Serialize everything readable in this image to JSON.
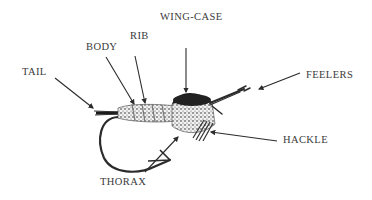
{
  "diagram": {
    "colors": {
      "ink": "#2b2b2b",
      "label": "#3a3a3a",
      "background": "#ffffff"
    },
    "labels": [
      {
        "id": "tail",
        "text": "TAIL",
        "x": 22,
        "y": 67
      },
      {
        "id": "body",
        "text": "BODY",
        "x": 86,
        "y": 42
      },
      {
        "id": "rib",
        "text": "RIB",
        "x": 130,
        "y": 31
      },
      {
        "id": "wing-case",
        "text": "WING-CASE",
        "x": 160,
        "y": 12
      },
      {
        "id": "feelers",
        "text": "FEELERS",
        "x": 306,
        "y": 70
      },
      {
        "id": "hackle",
        "text": "HACKLE",
        "x": 283,
        "y": 135
      },
      {
        "id": "thorax",
        "text": "THORAX",
        "x": 100,
        "y": 177
      }
    ],
    "arrows": [
      {
        "id": "tail",
        "x1": 55,
        "y1": 78,
        "x2": 93,
        "y2": 108
      },
      {
        "id": "body",
        "x1": 106,
        "y1": 57,
        "x2": 134,
        "y2": 104
      },
      {
        "id": "rib",
        "x1": 135,
        "y1": 56,
        "x2": 145,
        "y2": 103
      },
      {
        "id": "wing-case",
        "x1": 186,
        "y1": 48,
        "x2": 186,
        "y2": 92
      },
      {
        "id": "feelers",
        "x1": 300,
        "y1": 73,
        "x2": 259,
        "y2": 89
      },
      {
        "id": "hackle",
        "x1": 277,
        "y1": 141,
        "x2": 211,
        "y2": 132
      },
      {
        "id": "thorax",
        "x1": 145,
        "y1": 172,
        "x2": 178,
        "y2": 137
      }
    ]
  }
}
